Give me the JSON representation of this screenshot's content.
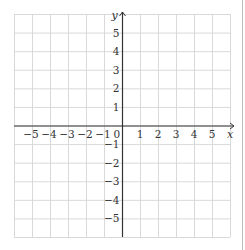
{
  "diagram": {
    "type": "coordinate_grid",
    "grid": {
      "x_min": -6,
      "x_max": 6,
      "y_min": -6,
      "y_max": 6,
      "left_px": 14,
      "right_px": 230,
      "top_px": 14,
      "bottom_px": 237,
      "grid_color": "#d9d9d9",
      "axis_color": "#333333"
    },
    "axes": {
      "x_label": "x",
      "y_label": "y",
      "origin_label": "0",
      "x_ticks": [
        "-5",
        "-4",
        "-3",
        "-2",
        "-1",
        "1",
        "2",
        "3",
        "4",
        "5"
      ],
      "x_tick_values": [
        -5,
        -4,
        -3,
        -2,
        -1,
        1,
        2,
        3,
        4,
        5
      ],
      "y_ticks": [
        "5",
        "4",
        "3",
        "2",
        "1",
        "-1",
        "-2",
        "-3",
        "-4",
        "-5"
      ],
      "y_tick_values": [
        5,
        4,
        3,
        2,
        1,
        -1,
        -2,
        -3,
        -4,
        -5
      ]
    }
  }
}
